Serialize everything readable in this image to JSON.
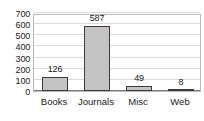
{
  "chart_data": {
    "type": "bar",
    "title": "",
    "subtitle": "",
    "xlabel": "",
    "ylabel": "",
    "categories": [
      "Books",
      "Journals",
      "Misc",
      "Web"
    ],
    "values": [
      126,
      587,
      49,
      8
    ],
    "data_labels": [
      "126",
      "587",
      "49",
      "8"
    ],
    "ylim": [
      0,
      700
    ],
    "yticks": [
      0,
      100,
      200,
      300,
      400,
      500,
      600,
      700
    ],
    "ytick_labels": [
      "0",
      "100",
      "200",
      "300",
      "400",
      "500",
      "600",
      "700"
    ],
    "grid": true,
    "legend": false,
    "series": [
      {
        "name": "",
        "values": [
          126,
          587,
          49,
          8
        ]
      }
    ],
    "colors": {
      "bar_fill": "#c4c4c4",
      "bar_border": "#3a3a3a",
      "gridline": "#d9d9d9",
      "axis_line": "#7d7d7d",
      "plot_border": "#b9b9b9",
      "text": "#1a1a1a",
      "background": "#ffffff"
    }
  }
}
